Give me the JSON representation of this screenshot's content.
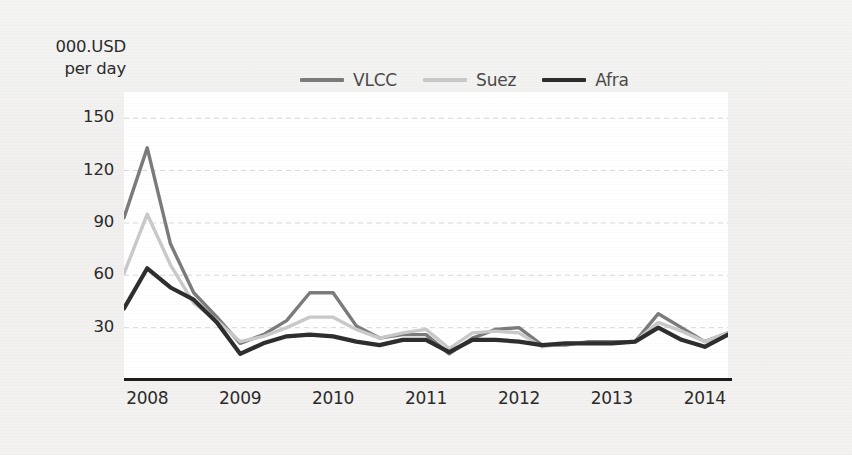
{
  "axis_title": {
    "line1": "000.USD",
    "line2": "per day"
  },
  "legend": {
    "items": [
      {
        "label": "VLCC",
        "color": "#7b7b7b",
        "swatch_name": "legend-swatch-vlcc"
      },
      {
        "label": "Suez",
        "color": "#c9c9c9",
        "swatch_name": "legend-swatch-suez"
      },
      {
        "label": "Afra",
        "color": "#2e2e2e",
        "swatch_name": "legend-swatch-afra"
      }
    ]
  },
  "y_ticks": [
    "150",
    "120",
    "90",
    "60",
    "30"
  ],
  "x_ticks": [
    "2008",
    "2009",
    "2010",
    "2011",
    "2012",
    "2013",
    "2014"
  ],
  "chart_data": {
    "type": "line",
    "title": "",
    "subtitle": "",
    "xlabel": "",
    "ylabel": "000.USD per day",
    "ylim": [
      0,
      165
    ],
    "y_ticks": [
      30,
      60,
      90,
      120,
      150
    ],
    "grid": true,
    "grid_style": "dashed-horizontal",
    "legend_position": "top-center",
    "x_tick_labels": [
      "2008",
      "2009",
      "2010",
      "2011",
      "2012",
      "2013",
      "2014"
    ],
    "x_tick_values": [
      2008.0,
      2009.0,
      2010.0,
      2011.0,
      2012.0,
      2013.0,
      2014.0
    ],
    "x_note": "quarterly observations from 2007Q4 through 2014Q2",
    "x": [
      2007.75,
      2008.0,
      2008.25,
      2008.5,
      2008.75,
      2009.0,
      2009.25,
      2009.5,
      2009.75,
      2010.0,
      2010.25,
      2010.5,
      2010.75,
      2011.0,
      2011.25,
      2011.5,
      2011.75,
      2012.0,
      2012.25,
      2012.5,
      2012.75,
      2013.0,
      2013.25,
      2013.5,
      2013.75,
      2014.0,
      2014.25
    ],
    "series": [
      {
        "name": "VLCC",
        "color": "#7b7b7b",
        "values": [
          93,
          133,
          78,
          50,
          36,
          21,
          26,
          34,
          50,
          50,
          31,
          24,
          26,
          26,
          15,
          24,
          29,
          30,
          20,
          20,
          22,
          22,
          22,
          38,
          30,
          22,
          27
        ]
      },
      {
        "name": "Suez",
        "color": "#c9c9c9",
        "values": [
          61,
          95,
          66,
          44,
          34,
          22,
          25,
          30,
          36,
          36,
          29,
          24,
          27,
          29,
          18,
          27,
          28,
          27,
          19,
          21,
          21,
          21,
          22,
          33,
          28,
          22,
          27
        ]
      },
      {
        "name": "Afra",
        "color": "#2e2e2e",
        "values": [
          41,
          64,
          53,
          46,
          33,
          15,
          21,
          25,
          26,
          25,
          22,
          20,
          23,
          23,
          16,
          23,
          23,
          22,
          20,
          21,
          21,
          21,
          22,
          30,
          23,
          19,
          26
        ]
      }
    ]
  },
  "colors": {
    "background": "#f2f2f0",
    "plot_background": "#ffffff",
    "axis_line": "#1d1d1d",
    "grid_line": "#d8d8d8",
    "tick_text": "#2b2b2b",
    "legend_text": "#4a4a4a"
  }
}
